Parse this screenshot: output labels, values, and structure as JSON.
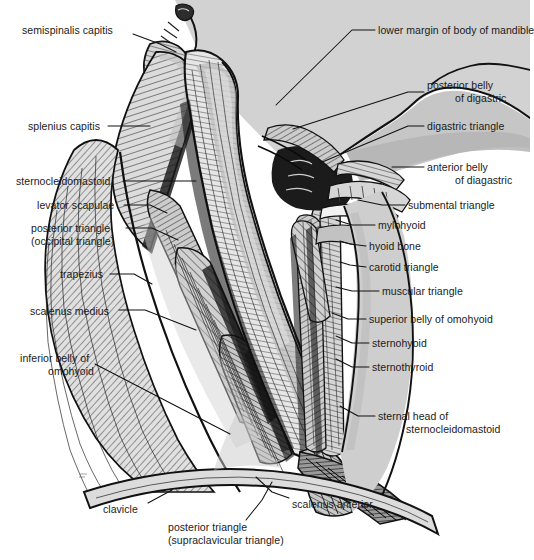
{
  "figure": {
    "palette": {
      "background": "#ffffff",
      "skin_light": "#d2d2d2",
      "skin_mid": "#bdbdbd",
      "muscle_light": "#e2e2e2",
      "muscle_mid": "#c4c4c4",
      "muscle_dark": "#8f8f8f",
      "shadow": "#5a5a5a",
      "outline": "#111111",
      "text": "#1a1a1a"
    },
    "text_color": "#1a1a1a"
  },
  "labels": {
    "left": [
      {
        "id": "semispinalis-capitis",
        "text": "semispinalis capitis",
        "x": 22,
        "y": 24,
        "align": "l",
        "leader": [
          [
            133,
            34
          ],
          [
            160,
            44
          ],
          [
            176,
            52
          ]
        ]
      },
      {
        "id": "splenius-capitis",
        "text": "splenius capitis",
        "x": 28,
        "y": 120,
        "align": "l",
        "leader": [
          [
            108,
            126
          ],
          [
            150,
            126
          ]
        ]
      },
      {
        "id": "sternocleidomastoid",
        "text": "sternocleidomastoid",
        "x": 16,
        "y": 175,
        "align": "l",
        "leader": [
          [
            123,
            181
          ],
          [
            196,
            181
          ]
        ]
      },
      {
        "id": "levator-scapulae",
        "text": "levator scapulae",
        "x": 37,
        "y": 199,
        "align": "l",
        "leader": [
          [
            124,
            205
          ],
          [
            150,
            205
          ],
          [
            167,
            213
          ]
        ]
      },
      {
        "id": "posterior-triangle-occipital",
        "text": "posterior triangle",
        "text2": "(occipital triangle)",
        "x": 31,
        "y": 222,
        "align": "l",
        "leader": [
          [
            126,
            228
          ],
          [
            152,
            228
          ],
          [
            178,
            240
          ]
        ]
      },
      {
        "id": "trapezius",
        "text": "trapezius",
        "x": 60,
        "y": 268,
        "align": "l",
        "leader": [
          [
            110,
            274
          ],
          [
            134,
            274
          ],
          [
            152,
            284
          ]
        ]
      },
      {
        "id": "scalenus-medius",
        "text": "scalenus medius",
        "x": 30,
        "y": 305,
        "align": "l",
        "leader": [
          [
            119,
            310
          ],
          [
            145,
            310
          ],
          [
            196,
            330
          ]
        ]
      },
      {
        "id": "inferior-belly-of-omohyoid",
        "text": "inferior belly of",
        "text2": "omohyoid",
        "x": 20,
        "y": 352,
        "align": "l",
        "leader": [
          [
            95,
            364
          ],
          [
            230,
            434
          ]
        ]
      },
      {
        "id": "clavicle",
        "text": "clavicle",
        "x": 103,
        "y": 503,
        "align": "l",
        "leader": [
          [
            148,
            503
          ],
          [
            172,
            490
          ]
        ]
      }
    ],
    "right": [
      {
        "id": "lower-margin-of-body-of-mandible",
        "text": "lower margin of body of mandible",
        "x": 378,
        "y": 24,
        "align": "l",
        "leader": [
          [
            375,
            30
          ],
          [
            352,
            30
          ],
          [
            276,
            105
          ]
        ]
      },
      {
        "id": "posterior-belly-of-digastric",
        "text": "posterior belly",
        "text2": "of digastric",
        "x": 427,
        "y": 79,
        "align": "l",
        "leader": [
          [
            424,
            92
          ],
          [
            408,
            92
          ],
          [
            293,
            129
          ]
        ]
      },
      {
        "id": "digastric-triangle",
        "text": "digastric triangle",
        "x": 427,
        "y": 120,
        "align": "l",
        "leader": [
          [
            424,
            126
          ],
          [
            408,
            126
          ],
          [
            320,
            163
          ]
        ]
      },
      {
        "id": "anterior-belly-of-digastric",
        "text": "anterior belly",
        "text2": "of diagastric",
        "x": 427,
        "y": 161,
        "align": "l",
        "leader": [
          [
            424,
            167
          ],
          [
            408,
            167
          ],
          [
            394,
            167
          ]
        ]
      },
      {
        "id": "submental-triangle",
        "text": "submental triangle",
        "x": 408,
        "y": 199,
        "align": "l",
        "leader": [
          [
            405,
            205
          ],
          [
            382,
            205
          ],
          [
            358,
            200
          ]
        ]
      },
      {
        "id": "mylohyoid",
        "text": "mylohyoid",
        "x": 378,
        "y": 219,
        "align": "l",
        "leader": [
          [
            375,
            225
          ],
          [
            352,
            225
          ],
          [
            336,
            220
          ]
        ]
      },
      {
        "id": "hyoid-bone",
        "text": "hyoid bone",
        "x": 369,
        "y": 240,
        "align": "l",
        "leader": [
          [
            366,
            246
          ],
          [
            350,
            244
          ],
          [
            340,
            241
          ]
        ]
      },
      {
        "id": "carotid-triangle",
        "text": "carotid triangle",
        "x": 369,
        "y": 261,
        "align": "l",
        "leader": [
          [
            366,
            267
          ],
          [
            350,
            265
          ],
          [
            340,
            262
          ]
        ]
      },
      {
        "id": "muscular-triangle",
        "text": "muscular triangle",
        "x": 382,
        "y": 285,
        "align": "l",
        "leader": [
          [
            379,
            291
          ],
          [
            352,
            291
          ],
          [
            336,
            287
          ]
        ]
      },
      {
        "id": "superior-belly-of-omohyoid",
        "text": "superior belly of omohyoid",
        "x": 369,
        "y": 313,
        "align": "l",
        "leader": [
          [
            366,
            319
          ],
          [
            348,
            319
          ],
          [
            334,
            313
          ]
        ]
      },
      {
        "id": "sternohyoid",
        "text": "sternohyoid",
        "x": 372,
        "y": 337,
        "align": "l",
        "leader": [
          [
            369,
            343
          ],
          [
            352,
            343
          ],
          [
            336,
            336
          ]
        ]
      },
      {
        "id": "sternothyroid",
        "text": "sternothyroid",
        "x": 372,
        "y": 361,
        "align": "l",
        "leader": [
          [
            369,
            367
          ],
          [
            352,
            367
          ],
          [
            336,
            359
          ]
        ]
      },
      {
        "id": "sternal-head-of-sternocleidomastoid",
        "text": "sternal head of",
        "text2": "sternocleidomastoid",
        "x": 378,
        "y": 410,
        "align": "l",
        "leader": [
          [
            375,
            416
          ],
          [
            358,
            416
          ],
          [
            340,
            406
          ]
        ]
      },
      {
        "id": "scalenus-anterior",
        "text": "scalenus anterior",
        "x": 292,
        "y": 498,
        "align": "l",
        "leader": [
          [
            289,
            498
          ],
          [
            272,
            492
          ],
          [
            256,
            477
          ]
        ]
      }
    ],
    "bottom": [
      {
        "id": "posterior-triangle-supraclavicular",
        "text": "posterior triangle",
        "text2": "(supraclavicular triangle)",
        "x": 168,
        "y": 521,
        "align": "l",
        "leader": [
          [
            246,
            520
          ],
          [
            262,
            500
          ],
          [
            272,
            482
          ]
        ]
      }
    ]
  }
}
